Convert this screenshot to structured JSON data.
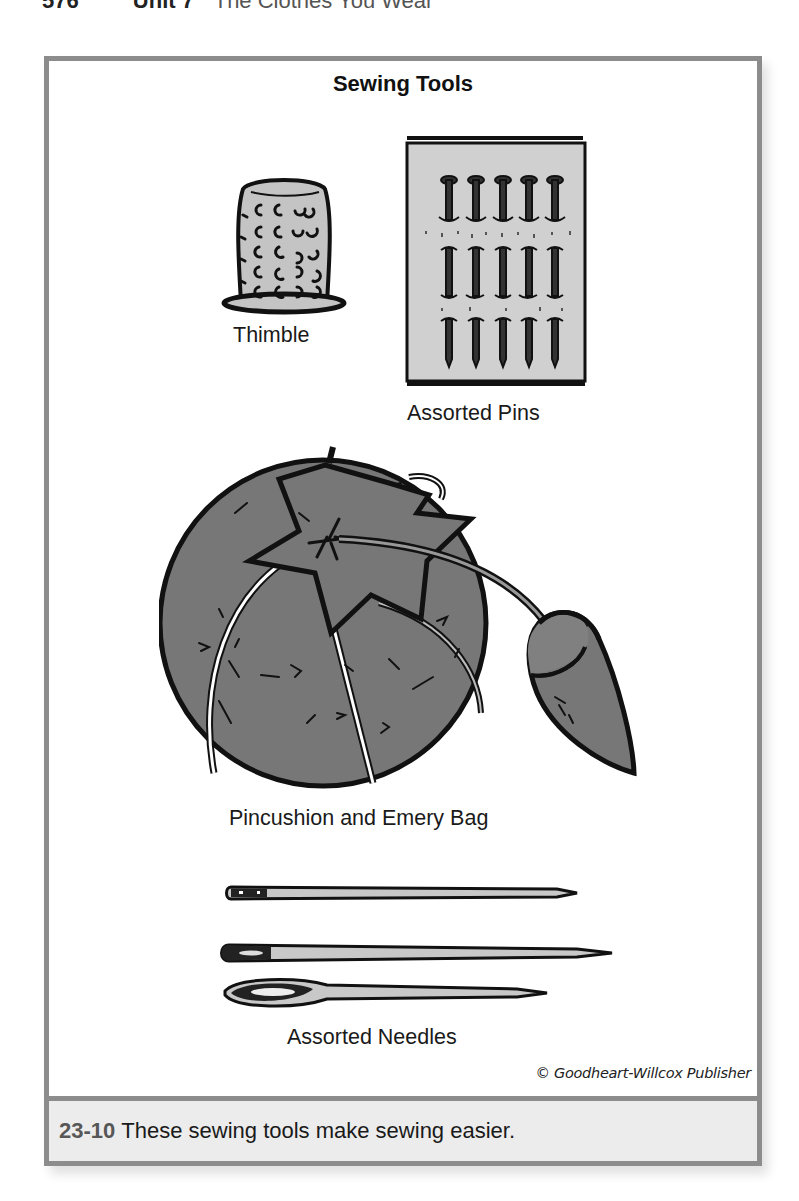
{
  "running_head": {
    "page_number": "576",
    "unit": "Unit 7",
    "title": "The Clothes You Wear"
  },
  "figure": {
    "title": "Sewing Tools",
    "items": [
      {
        "label": "Thimble",
        "icon": "thimble-icon"
      },
      {
        "label": "Assorted Pins",
        "icon": "pins-card-icon"
      },
      {
        "label": "Pincushion and Emery Bag",
        "icon": "pincushion-icon"
      },
      {
        "label": "Assorted Needles",
        "icon": "needles-icon"
      }
    ],
    "credit": "© Goodheart-Willcox Publisher",
    "colors": {
      "border": "#8c8c8c",
      "caption_bg": "#ececec",
      "figure_number": "#575757",
      "pincushion_fill": "#777777",
      "light_fill": "#c8c8c8"
    }
  },
  "caption": {
    "number": "23-10",
    "text": "These sewing tools make sewing easier."
  }
}
